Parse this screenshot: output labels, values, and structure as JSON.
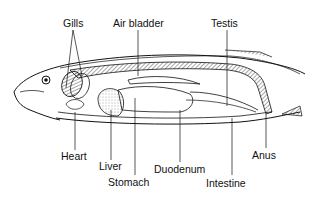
{
  "diagram": {
    "labels": {
      "gills": "Gills",
      "air_bladder": "Air bladder",
      "testis": "Testis",
      "heart": "Heart",
      "liver": "Liver",
      "stomach": "Stomach",
      "duodenum": "Duodenum",
      "intestine": "Intestine",
      "anus": "Anus"
    },
    "colors": {
      "line": "#111111",
      "background": "#ffffff"
    }
  }
}
